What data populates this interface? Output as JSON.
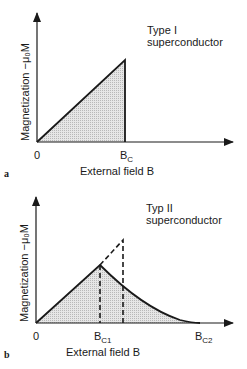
{
  "panels": [
    {
      "id": "a",
      "panel_label": "a",
      "title_line1": "Type I",
      "title_line2": "superconductor",
      "ylabel": "Magnetization −μ₀M",
      "xlabel": "External field B",
      "x_ticks": {
        "origin": "0",
        "bc_main": "B",
        "bc_sub": "C"
      }
    },
    {
      "id": "b",
      "panel_label": "b",
      "title_line1": "Typ II",
      "title_line2": "superconductor",
      "ylabel": "Magnetization −μ₀M",
      "xlabel": "External field B",
      "x_ticks": {
        "origin": "0",
        "bc1_main": "B",
        "bc1_sub": "C1",
        "bc2_main": "B",
        "bc2_sub": "C2"
      }
    }
  ],
  "colors": {
    "line": "#1a1a1a",
    "fill": "#d9d9d9"
  }
}
